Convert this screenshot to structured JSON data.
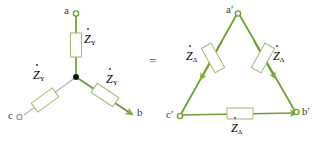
{
  "figure": {
    "kind": "circuit-diagram",
    "equals_symbol": "=",
    "colors": {
      "wire_green": "#6d9f2a",
      "wire_gray": "#b5b5b5",
      "component_outline": "#8fae5d",
      "component_fill": "#ffffff",
      "arrow_green": "#76b22e",
      "text": "#3c3c3c",
      "node_dot": "#1a1a1a",
      "background": "#ffffff"
    }
  },
  "star": {
    "name": "Y-connection",
    "nodes": [
      {
        "id": "a",
        "label": "a",
        "x": 76,
        "y": 14,
        "marker": "open-circle"
      },
      {
        "id": "b",
        "label": "b",
        "x": 131,
        "y": 114,
        "marker": "arrow-head"
      },
      {
        "id": "c",
        "label": "c",
        "x": 20,
        "y": 116,
        "marker": "open-circle"
      },
      {
        "id": "n",
        "label": "",
        "x": 76,
        "y": 77,
        "marker": "filled-dot"
      }
    ],
    "branches": [
      {
        "id": "a-n",
        "impedance": "Z",
        "dot": true,
        "subscript": "Y",
        "label_x": 84,
        "label_y": 38
      },
      {
        "id": "b-n",
        "impedance": "Z",
        "dot": true,
        "subscript": "Y",
        "label_x": 106,
        "label_y": 78
      },
      {
        "id": "c-n",
        "impedance": "Z",
        "dot": true,
        "subscript": "Y",
        "label_x": 33,
        "label_y": 74
      }
    ]
  },
  "delta": {
    "name": "Delta-connection",
    "nodes": [
      {
        "id": "a2",
        "label": "a",
        "prime": "′",
        "x": 238,
        "y": 13,
        "marker": "open-circle"
      },
      {
        "id": "b2",
        "label": "b",
        "prime": "′",
        "x": 297,
        "y": 114,
        "marker": "open-circle"
      },
      {
        "id": "c2",
        "label": "c",
        "prime": "′",
        "x": 180,
        "y": 116,
        "marker": "open-circle"
      }
    ],
    "branches": [
      {
        "id": "a-c-side",
        "impedance": "Z",
        "dot": true,
        "subscript": "Δ",
        "label_x": 188,
        "label_y": 55
      },
      {
        "id": "a-b-side",
        "impedance": "Z",
        "dot": true,
        "subscript": "Δ",
        "label_x": 273,
        "label_y": 55
      },
      {
        "id": "c-b-side",
        "impedance": "Z",
        "dot": true,
        "subscript": "Δ",
        "label_x": 228,
        "label_y": 124
      }
    ]
  }
}
